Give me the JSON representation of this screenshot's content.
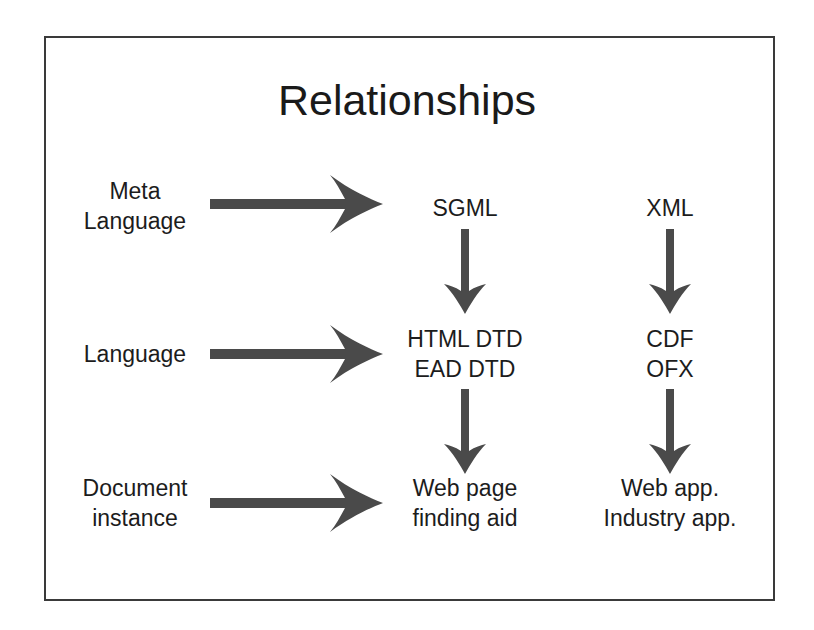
{
  "title": "Relationships",
  "rows": [
    {
      "label": [
        "Meta",
        "Language"
      ]
    },
    {
      "label": [
        "Language"
      ]
    },
    {
      "label": [
        "Document",
        "instance"
      ]
    }
  ],
  "columns": {
    "sgml": {
      "meta": [
        "SGML"
      ],
      "language": [
        "HTML DTD",
        "EAD DTD"
      ],
      "instance": [
        "Web page",
        "finding aid"
      ]
    },
    "xml": {
      "meta": [
        "XML"
      ],
      "language": [
        "CDF",
        "OFX"
      ],
      "instance": [
        "Web app.",
        "Industry app."
      ]
    }
  },
  "colors": {
    "arrow": "#4a4a4a",
    "frame": "#3a3a3a",
    "text": "#1a1a1a"
  }
}
